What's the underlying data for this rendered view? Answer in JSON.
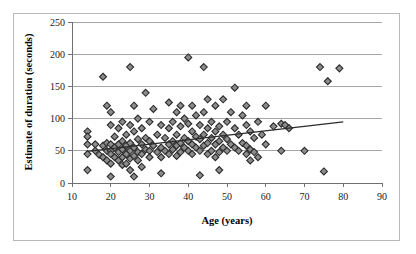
{
  "chart_data": {
    "type": "scatter",
    "title": "",
    "xlabel": "Age (years)",
    "ylabel": "Estimate of duration (seconds)",
    "xlim": [
      10,
      90
    ],
    "ylim": [
      0,
      250
    ],
    "xticks": [
      10,
      20,
      30,
      40,
      50,
      60,
      70,
      80,
      90
    ],
    "yticks": [
      0,
      50,
      100,
      150,
      200,
      250
    ],
    "grid": "horizontal",
    "legend": "none",
    "marker": "diamond",
    "marker_fill": "#8c8c8c",
    "marker_edge": "#2b2b2b",
    "trendline": {
      "visible": true,
      "type": "linear",
      "x": [
        14,
        80
      ],
      "y": [
        49,
        95
      ],
      "color": "#2b2b2b"
    },
    "points": [
      {
        "x": 14,
        "y": 80
      },
      {
        "x": 14,
        "y": 72
      },
      {
        "x": 14,
        "y": 60
      },
      {
        "x": 14,
        "y": 45
      },
      {
        "x": 14,
        "y": 20
      },
      {
        "x": 16,
        "y": 60
      },
      {
        "x": 16,
        "y": 50
      },
      {
        "x": 17,
        "y": 44
      },
      {
        "x": 18,
        "y": 165
      },
      {
        "x": 18,
        "y": 58
      },
      {
        "x": 18,
        "y": 40
      },
      {
        "x": 19,
        "y": 120
      },
      {
        "x": 19,
        "y": 62
      },
      {
        "x": 19,
        "y": 50
      },
      {
        "x": 19,
        "y": 35
      },
      {
        "x": 20,
        "y": 110
      },
      {
        "x": 20,
        "y": 90
      },
      {
        "x": 20,
        "y": 60
      },
      {
        "x": 20,
        "y": 50
      },
      {
        "x": 20,
        "y": 45
      },
      {
        "x": 20,
        "y": 30
      },
      {
        "x": 20,
        "y": 10
      },
      {
        "x": 21,
        "y": 72
      },
      {
        "x": 21,
        "y": 55
      },
      {
        "x": 21,
        "y": 40
      },
      {
        "x": 22,
        "y": 85
      },
      {
        "x": 22,
        "y": 60
      },
      {
        "x": 22,
        "y": 48
      },
      {
        "x": 22,
        "y": 35
      },
      {
        "x": 23,
        "y": 95
      },
      {
        "x": 23,
        "y": 65
      },
      {
        "x": 23,
        "y": 52
      },
      {
        "x": 23,
        "y": 40
      },
      {
        "x": 23,
        "y": 28
      },
      {
        "x": 24,
        "y": 75
      },
      {
        "x": 24,
        "y": 58
      },
      {
        "x": 24,
        "y": 45
      },
      {
        "x": 24,
        "y": 30
      },
      {
        "x": 25,
        "y": 180
      },
      {
        "x": 25,
        "y": 90
      },
      {
        "x": 25,
        "y": 62
      },
      {
        "x": 25,
        "y": 50
      },
      {
        "x": 25,
        "y": 38
      },
      {
        "x": 25,
        "y": 20
      },
      {
        "x": 26,
        "y": 120
      },
      {
        "x": 26,
        "y": 80
      },
      {
        "x": 26,
        "y": 55
      },
      {
        "x": 26,
        "y": 42
      },
      {
        "x": 26,
        "y": 10
      },
      {
        "x": 27,
        "y": 100
      },
      {
        "x": 27,
        "y": 68
      },
      {
        "x": 27,
        "y": 48
      },
      {
        "x": 27,
        "y": 35
      },
      {
        "x": 28,
        "y": 85
      },
      {
        "x": 28,
        "y": 60
      },
      {
        "x": 28,
        "y": 45
      },
      {
        "x": 28,
        "y": 25
      },
      {
        "x": 29,
        "y": 140
      },
      {
        "x": 29,
        "y": 70
      },
      {
        "x": 29,
        "y": 52
      },
      {
        "x": 30,
        "y": 95
      },
      {
        "x": 30,
        "y": 65
      },
      {
        "x": 30,
        "y": 50
      },
      {
        "x": 30,
        "y": 40
      },
      {
        "x": 31,
        "y": 115
      },
      {
        "x": 31,
        "y": 58
      },
      {
        "x": 32,
        "y": 75
      },
      {
        "x": 32,
        "y": 48
      },
      {
        "x": 33,
        "y": 90
      },
      {
        "x": 33,
        "y": 55
      },
      {
        "x": 33,
        "y": 40
      },
      {
        "x": 33,
        "y": 15
      },
      {
        "x": 34,
        "y": 70
      },
      {
        "x": 34,
        "y": 50
      },
      {
        "x": 35,
        "y": 125
      },
      {
        "x": 35,
        "y": 85
      },
      {
        "x": 35,
        "y": 60
      },
      {
        "x": 35,
        "y": 45
      },
      {
        "x": 36,
        "y": 95
      },
      {
        "x": 36,
        "y": 65
      },
      {
        "x": 36,
        "y": 52
      },
      {
        "x": 37,
        "y": 110
      },
      {
        "x": 37,
        "y": 75
      },
      {
        "x": 37,
        "y": 58
      },
      {
        "x": 37,
        "y": 42
      },
      {
        "x": 38,
        "y": 120
      },
      {
        "x": 38,
        "y": 88
      },
      {
        "x": 38,
        "y": 62
      },
      {
        "x": 38,
        "y": 48
      },
      {
        "x": 39,
        "y": 100
      },
      {
        "x": 39,
        "y": 70
      },
      {
        "x": 39,
        "y": 55
      },
      {
        "x": 40,
        "y": 195
      },
      {
        "x": 40,
        "y": 92
      },
      {
        "x": 40,
        "y": 65
      },
      {
        "x": 40,
        "y": 50
      },
      {
        "x": 41,
        "y": 120
      },
      {
        "x": 41,
        "y": 80
      },
      {
        "x": 41,
        "y": 60
      },
      {
        "x": 41,
        "y": 45
      },
      {
        "x": 42,
        "y": 105
      },
      {
        "x": 42,
        "y": 72
      },
      {
        "x": 42,
        "y": 55
      },
      {
        "x": 43,
        "y": 90
      },
      {
        "x": 43,
        "y": 68
      },
      {
        "x": 43,
        "y": 50
      },
      {
        "x": 43,
        "y": 12
      },
      {
        "x": 44,
        "y": 180
      },
      {
        "x": 44,
        "y": 110
      },
      {
        "x": 44,
        "y": 75
      },
      {
        "x": 44,
        "y": 58
      },
      {
        "x": 45,
        "y": 130
      },
      {
        "x": 45,
        "y": 85
      },
      {
        "x": 45,
        "y": 62
      },
      {
        "x": 45,
        "y": 45
      },
      {
        "x": 46,
        "y": 95
      },
      {
        "x": 46,
        "y": 70
      },
      {
        "x": 46,
        "y": 50
      },
      {
        "x": 47,
        "y": 120
      },
      {
        "x": 47,
        "y": 80
      },
      {
        "x": 47,
        "y": 60
      },
      {
        "x": 47,
        "y": 40
      },
      {
        "x": 48,
        "y": 88
      },
      {
        "x": 48,
        "y": 65
      },
      {
        "x": 48,
        "y": 48
      },
      {
        "x": 48,
        "y": 20
      },
      {
        "x": 49,
        "y": 130
      },
      {
        "x": 49,
        "y": 75
      },
      {
        "x": 49,
        "y": 55
      },
      {
        "x": 50,
        "y": 95
      },
      {
        "x": 50,
        "y": 68
      },
      {
        "x": 50,
        "y": 50
      },
      {
        "x": 51,
        "y": 110
      },
      {
        "x": 51,
        "y": 60
      },
      {
        "x": 52,
        "y": 148
      },
      {
        "x": 52,
        "y": 85
      },
      {
        "x": 52,
        "y": 55
      },
      {
        "x": 53,
        "y": 75
      },
      {
        "x": 53,
        "y": 50
      },
      {
        "x": 54,
        "y": 105
      },
      {
        "x": 54,
        "y": 62
      },
      {
        "x": 55,
        "y": 120
      },
      {
        "x": 55,
        "y": 90
      },
      {
        "x": 55,
        "y": 58
      },
      {
        "x": 55,
        "y": 45
      },
      {
        "x": 56,
        "y": 80
      },
      {
        "x": 56,
        "y": 52
      },
      {
        "x": 56,
        "y": 35
      },
      {
        "x": 57,
        "y": 70
      },
      {
        "x": 57,
        "y": 48
      },
      {
        "x": 58,
        "y": 95
      },
      {
        "x": 58,
        "y": 40
      },
      {
        "x": 59,
        "y": 75
      },
      {
        "x": 60,
        "y": 120
      },
      {
        "x": 60,
        "y": 60
      },
      {
        "x": 62,
        "y": 88
      },
      {
        "x": 64,
        "y": 50
      },
      {
        "x": 64,
        "y": 92
      },
      {
        "x": 65,
        "y": 90
      },
      {
        "x": 66,
        "y": 85
      },
      {
        "x": 70,
        "y": 50
      },
      {
        "x": 74,
        "y": 180
      },
      {
        "x": 75,
        "y": 18
      },
      {
        "x": 76,
        "y": 158
      },
      {
        "x": 79,
        "y": 178
      }
    ]
  }
}
